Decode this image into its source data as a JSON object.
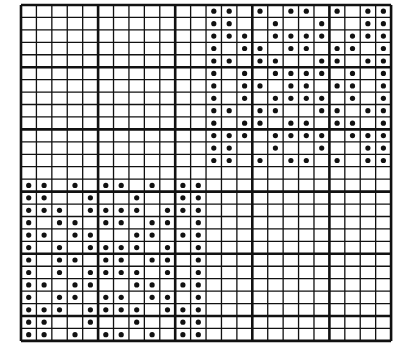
{
  "diagram": {
    "type": "dot-grid-pattern",
    "colors": {
      "background": "#ffffff",
      "line": "#111111",
      "dot": "#111111"
    },
    "grid": {
      "columns": 24,
      "rows": 27,
      "origin_x": 21,
      "origin_y": 5,
      "cell_width": 15.42,
      "cell_height": 12.44,
      "major_every": 5,
      "minor_line_width": 1.3,
      "major_line_width": 2.6
    },
    "motif": {
      "rows": [
        [
          0,
          1,
          3,
          5,
          6,
          8,
          10,
          11
        ],
        [
          0,
          1,
          4,
          7,
          10,
          11
        ],
        [
          0,
          1,
          2,
          4,
          5,
          6,
          7,
          9,
          10,
          11
        ],
        [
          0,
          2,
          3,
          5,
          6,
          8,
          9,
          11
        ],
        [
          0,
          1,
          3,
          4,
          7,
          8,
          10,
          11
        ],
        [
          0,
          2,
          4,
          5,
          6,
          7,
          9,
          11
        ],
        [
          0,
          2,
          3,
          5,
          6,
          8,
          9,
          11
        ],
        [
          0,
          2,
          4,
          5,
          6,
          7,
          9,
          11
        ],
        [
          0,
          1,
          3,
          4,
          7,
          8,
          10,
          11
        ],
        [
          0,
          2,
          3,
          5,
          6,
          8,
          9,
          11
        ],
        [
          0,
          1,
          2,
          4,
          5,
          6,
          7,
          9,
          10,
          11
        ],
        [
          0,
          1,
          4,
          7,
          10,
          11
        ],
        [
          0,
          1,
          3,
          5,
          6,
          8,
          10,
          11
        ]
      ]
    },
    "placements": [
      {
        "name": "top-right-motif",
        "row_offset": 0,
        "col_offset": 12
      },
      {
        "name": "bottom-left-motif",
        "row_offset": 14,
        "col_offset": 0
      }
    ]
  }
}
